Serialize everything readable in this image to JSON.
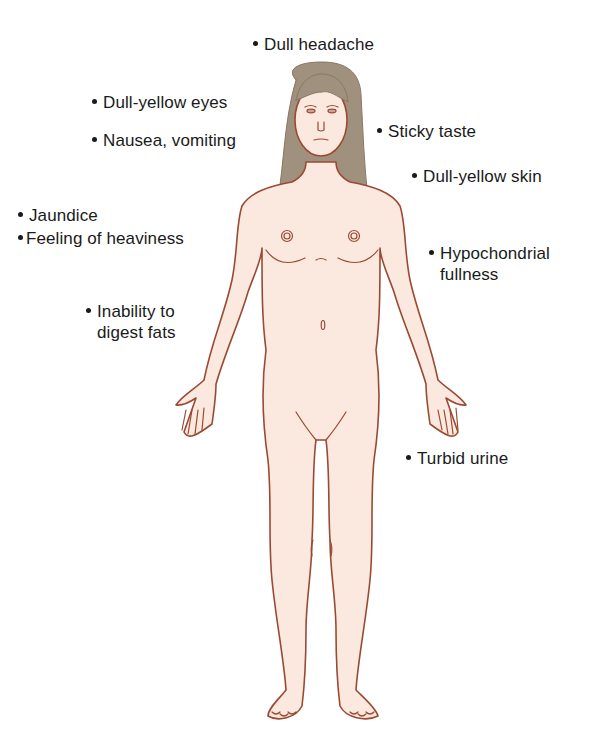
{
  "colors": {
    "skin": "#fbe9df",
    "outline": "#9a4a32",
    "hair": "#a0907e",
    "text": "#1a1a1a",
    "background": "#ffffff"
  },
  "labels": {
    "dull_headache": {
      "text": "Dull headache"
    },
    "dull_yellow_eyes": {
      "text": "Dull-yellow eyes"
    },
    "nausea_vomiting": {
      "text": "Nausea, vomiting"
    },
    "sticky_taste": {
      "text": "Sticky taste"
    },
    "dull_yellow_skin": {
      "text": "Dull-yellow skin"
    },
    "jaundice": {
      "text": "Jaundice"
    },
    "feeling_of_heaviness": {
      "text": "Feeling of heaviness"
    },
    "hypochondrial_fullness": {
      "line1": "Hypochondrial",
      "line2": "fullness"
    },
    "inability_to_digest_fats": {
      "line1": "Inability to",
      "line2": "digest fats"
    },
    "turbid_urine": {
      "text": "Turbid urine"
    }
  }
}
